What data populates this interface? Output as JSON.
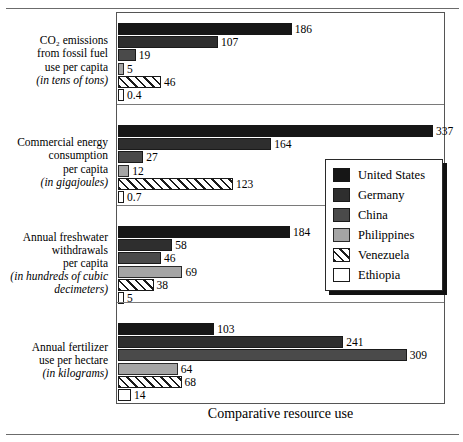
{
  "caption": "Comparative resource use",
  "legend": {
    "items": [
      {
        "label": "United States",
        "swatch": "solid-black",
        "color": "#161616"
      },
      {
        "label": "Germany",
        "swatch": "solid-dark-gray",
        "color": "#2e2e2e"
      },
      {
        "label": "China",
        "swatch": "solid-gray",
        "color": "#4a4a4a"
      },
      {
        "label": "Philippines",
        "swatch": "solid-light-gray",
        "color": "#a5a5a5"
      },
      {
        "label": "Venezuela",
        "swatch": "diagonal-hatch",
        "color": "#ffffff"
      },
      {
        "label": "Ethiopia",
        "swatch": "white-outline",
        "color": "#ffffff"
      }
    ]
  },
  "chart_data": {
    "type": "bar",
    "orientation": "horizontal",
    "title": "Comparative resource use",
    "xlabel": "",
    "ylabel": "",
    "grid": false,
    "legend_position": "right-middle",
    "xlim": [
      0,
      337
    ],
    "categories": [
      "CO2 emissions from fossil fuel use per capita (in tens of tons)",
      "Commercial energy consumption per capita (in gigajoules)",
      "Annual freshwater withdrawals per capita (in hundreds of cubic decimeters)",
      "Annual fertilizer use per hectare (in kilograms)"
    ],
    "series": [
      {
        "name": "United States",
        "values": [
          186,
          337,
          184,
          103
        ]
      },
      {
        "name": "Germany",
        "values": [
          107,
          164,
          58,
          241
        ]
      },
      {
        "name": "China",
        "values": [
          19,
          27,
          46,
          309
        ]
      },
      {
        "name": "Philippines",
        "values": [
          5,
          12,
          69,
          64
        ]
      },
      {
        "name": "Venezuela",
        "values": [
          46,
          123,
          38,
          68
        ]
      },
      {
        "name": "Ethiopia",
        "values": [
          0.4,
          0.7,
          5,
          14
        ]
      }
    ]
  },
  "groups": [
    {
      "name": "co2-emissions",
      "label_lines": [
        "CO",
        "2",
        " emissions",
        "from fossil fuel",
        "use per capita"
      ],
      "title_line1": "CO₂ emissions",
      "title_line2": "from fossil fuel",
      "title_line3": "use per capita",
      "unit": "(in tens of tons)",
      "bars": [
        {
          "series": "United States",
          "value": 186,
          "value_label": "186",
          "swatch": "solid-black"
        },
        {
          "series": "Germany",
          "value": 107,
          "value_label": "107",
          "swatch": "solid-dark-gray"
        },
        {
          "series": "China",
          "value": 19,
          "value_label": "19",
          "swatch": "solid-gray"
        },
        {
          "series": "Philippines",
          "value": 5,
          "value_label": "5",
          "swatch": "solid-light-gray"
        },
        {
          "series": "Venezuela",
          "value": 46,
          "value_label": "46",
          "swatch": "diagonal-hatch"
        },
        {
          "series": "Ethiopia",
          "value": 0.4,
          "value_label": "0.4",
          "swatch": "white-outline"
        }
      ]
    },
    {
      "name": "commercial-energy",
      "title_line1": "Commercial energy",
      "title_line2": "consumption",
      "title_line3": "per capita",
      "unit": "(in gigajoules)",
      "bars": [
        {
          "series": "United States",
          "value": 337,
          "value_label": "337",
          "swatch": "solid-black"
        },
        {
          "series": "Germany",
          "value": 164,
          "value_label": "164",
          "swatch": "solid-dark-gray"
        },
        {
          "series": "China",
          "value": 27,
          "value_label": "27",
          "swatch": "solid-gray"
        },
        {
          "series": "Philippines",
          "value": 12,
          "value_label": "12",
          "swatch": "solid-light-gray"
        },
        {
          "series": "Venezuela",
          "value": 123,
          "value_label": "123",
          "swatch": "diagonal-hatch"
        },
        {
          "series": "Ethiopia",
          "value": 0.7,
          "value_label": "0.7",
          "swatch": "white-outline"
        }
      ]
    },
    {
      "name": "freshwater-withdrawals",
      "title_line1": "Annual freshwater",
      "title_line2": "withdrawals",
      "title_line3": "per capita",
      "unit": "(in hundreds of cubic",
      "unit2": "decimeters)",
      "bars": [
        {
          "series": "United States",
          "value": 184,
          "value_label": "184",
          "swatch": "solid-black"
        },
        {
          "series": "Germany",
          "value": 58,
          "value_label": "58",
          "swatch": "solid-dark-gray"
        },
        {
          "series": "China",
          "value": 46,
          "value_label": "46",
          "swatch": "solid-gray"
        },
        {
          "series": "Philippines",
          "value": 69,
          "value_label": "69",
          "swatch": "solid-light-gray"
        },
        {
          "series": "Venezuela",
          "value": 38,
          "value_label": "38",
          "swatch": "diagonal-hatch"
        },
        {
          "series": "Ethiopia",
          "value": 5,
          "value_label": "5",
          "swatch": "white-outline"
        }
      ]
    },
    {
      "name": "fertilizer-use",
      "title_line1": "Annual fertilizer",
      "title_line2": "use per hectare",
      "title_line3": "",
      "unit": "(in kilograms)",
      "bars": [
        {
          "series": "United States",
          "value": 103,
          "value_label": "103",
          "swatch": "solid-black"
        },
        {
          "series": "Germany",
          "value": 241,
          "value_label": "241",
          "swatch": "solid-dark-gray"
        },
        {
          "series": "China",
          "value": 309,
          "value_label": "309",
          "swatch": "solid-gray"
        },
        {
          "series": "Philippines",
          "value": 64,
          "value_label": "64",
          "swatch": "solid-light-gray"
        },
        {
          "series": "Venezuela",
          "value": 68,
          "value_label": "68",
          "swatch": "diagonal-hatch"
        },
        {
          "series": "Ethiopia",
          "value": 14,
          "value_label": "14",
          "swatch": "white-outline"
        }
      ]
    }
  ]
}
